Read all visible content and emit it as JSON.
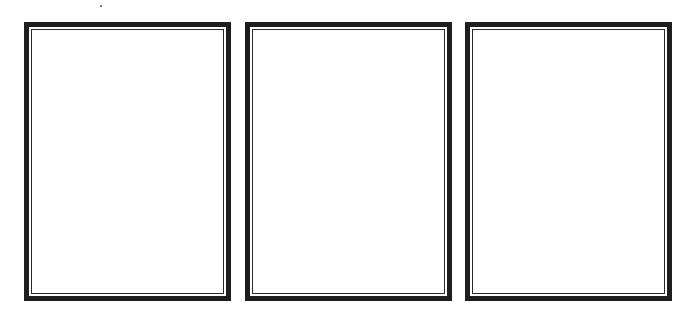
{
  "panels": [
    {
      "id": "panel-1",
      "left": 24,
      "content": ""
    },
    {
      "id": "panel-2",
      "left": 245,
      "content": ""
    },
    {
      "id": "panel-3",
      "left": 465,
      "content": ""
    }
  ],
  "colors": {
    "border": "#1e1e1e",
    "inner_line": "#2a2a2a",
    "background": "#ffffff"
  }
}
